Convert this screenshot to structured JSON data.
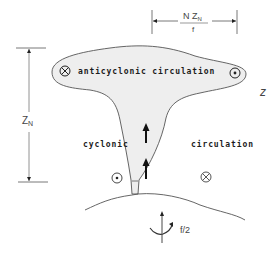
{
  "diagram": {
    "type": "vortex-column-schematic",
    "labels": {
      "top_region": "anticyclonic circulation",
      "lower_left": "cyclonic",
      "lower_right": "circulation",
      "height_symbol": "Z",
      "height_subscript": "N",
      "width_numerator_main": "N Z",
      "width_numerator_subscript": "N",
      "width_denominator": "f",
      "axis_label": "z",
      "rotation_label": "f/2"
    },
    "symbols": {
      "top_left": "into-page (⊗)",
      "top_right": "out-of-page (⊙)",
      "bottom_left": "out-of-page (⊙)",
      "bottom_right": "into-page (⊗)"
    },
    "colors": {
      "line": "#555555",
      "fill": "#eeeeee",
      "text": "#1c1c1c"
    }
  }
}
